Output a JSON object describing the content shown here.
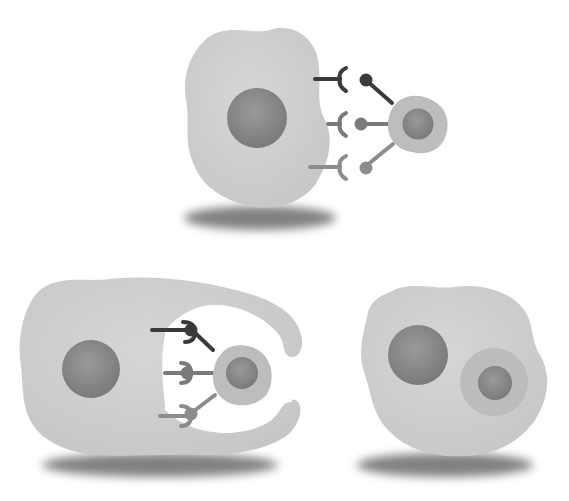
{
  "figure": {
    "cropped_header_text": "",
    "colors": {
      "background": "#ffffff",
      "cytoplasm": "#cfcfcf",
      "nucleus": "#8a8a8a",
      "target_cytoplasm": "#bdbdbd",
      "target_nucleus": "#7c7c7c",
      "receptor_dark": "#3a3a3a",
      "receptor_mid": "#7a7a7a",
      "receptor_light": "#8c8c8c",
      "shadow": "#6a6a6a"
    },
    "panels": [
      {
        "id": "recognition",
        "label": "Recognition and binding"
      },
      {
        "id": "engulfment",
        "label": "Pseudopod engulfment"
      },
      {
        "id": "ingestion",
        "label": "Ingested phagosome"
      }
    ]
  }
}
